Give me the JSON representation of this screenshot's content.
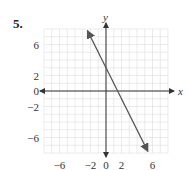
{
  "problem": {
    "number": "5."
  },
  "chart_data": {
    "type": "line",
    "title": "",
    "xlabel": "x",
    "ylabel": "y",
    "xlim": [
      -8,
      8
    ],
    "ylim": [
      -8,
      8
    ],
    "grid": true,
    "x_ticks": [
      {
        "value": -6,
        "label": "−6"
      },
      {
        "value": -2,
        "label": "−2"
      },
      {
        "value": 0,
        "label": "0"
      },
      {
        "value": 2,
        "label": "2"
      },
      {
        "value": 6,
        "label": "6"
      }
    ],
    "y_ticks": [
      {
        "value": 6,
        "label": "6"
      },
      {
        "value": 2,
        "label": "2"
      },
      {
        "value": 0,
        "label": "0"
      },
      {
        "value": -2,
        "label": "−2"
      },
      {
        "value": -6,
        "label": "−6"
      }
    ],
    "series": [
      {
        "name": "line",
        "equation": "y = -2x + 3",
        "x": [
          -2.4,
          5.4
        ],
        "y": [
          7.8,
          -7.8
        ],
        "arrows": "both",
        "color": "#555555"
      }
    ]
  },
  "colors": {
    "grid": "#dddddd",
    "axis": "#333333",
    "line": "#555555"
  }
}
